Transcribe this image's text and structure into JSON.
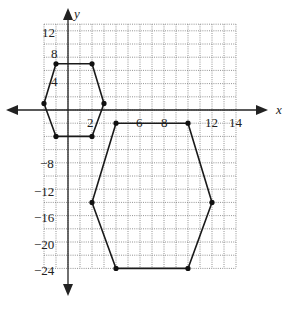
{
  "chart_data": {
    "type": "coordinate-plane",
    "title": "",
    "xlabel": "x",
    "ylabel": "y",
    "xlim": [
      -2,
      14
    ],
    "ylim": [
      -24,
      13
    ],
    "grid": true,
    "x_tick_labels": [
      "2",
      "6",
      "8",
      "12",
      "14"
    ],
    "x_tick_values": [
      2,
      6,
      8,
      12,
      14
    ],
    "y_tick_labels": [
      "12",
      "8",
      "4",
      "-8",
      "-12",
      "-16",
      "-20",
      "-24"
    ],
    "y_tick_values": [
      12,
      8,
      4,
      -8,
      -12,
      -16,
      -20,
      -24
    ],
    "shapes": [
      {
        "name": "small-hexagon",
        "vertices": [
          [
            -1,
            7
          ],
          [
            2,
            7
          ],
          [
            3,
            1
          ],
          [
            2,
            -4
          ],
          [
            -1,
            -4
          ],
          [
            -2,
            1
          ]
        ]
      },
      {
        "name": "large-hexagon",
        "vertices": [
          [
            4,
            -2
          ],
          [
            10,
            -2
          ],
          [
            12,
            -14
          ],
          [
            10,
            -24
          ],
          [
            4,
            -24
          ],
          [
            2,
            -14
          ]
        ]
      }
    ]
  },
  "labels": {
    "x_axis": "x",
    "y_axis": "y",
    "x_ticks": [
      "2",
      "6",
      "8",
      "12",
      "14"
    ],
    "y_ticks": [
      "12",
      "8",
      "4",
      "−8",
      "−12",
      "−16",
      "−20",
      "−24"
    ]
  }
}
